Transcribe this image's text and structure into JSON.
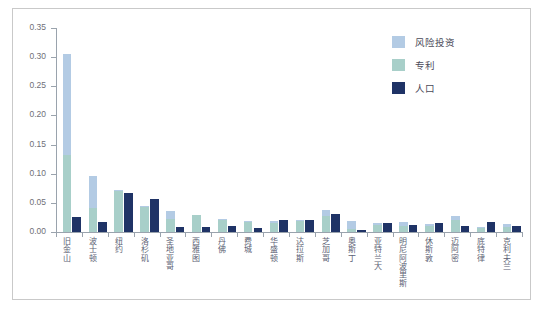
{
  "chart_data": {
    "type": "bar",
    "title": "",
    "subtitle": "",
    "xlabel": "",
    "ylabel": "",
    "ylim": [
      0.0,
      0.35
    ],
    "ytick_labels": [
      "0.00",
      "0.05",
      "0.10",
      "0.15",
      "0.20",
      "0.25",
      "0.30",
      "0.35"
    ],
    "ytick_values": [
      0.0,
      0.05,
      0.1,
      0.15,
      0.2,
      0.25,
      0.3,
      0.35
    ],
    "grid": false,
    "legend_position": "top-right",
    "bar_style": "overlapped-vc-patent-with-offset-population",
    "categories": [
      "旧金山",
      "波士顿",
      "纽约",
      "洛杉矶",
      "圣地亚哥",
      "西雅图",
      "丹佛",
      "费城",
      "华盛顿",
      "达拉斯",
      "芝加哥",
      "奥斯丁",
      "亚特兰大",
      "明尼阿波里斯",
      "休斯敦",
      "迈阿密",
      "底特律",
      "克利夫兰"
    ],
    "series": [
      {
        "name": "风险投资",
        "color": "#b3cbe4",
        "values": [
          0.305,
          0.097,
          0.072,
          0.044,
          0.036,
          0.03,
          0.023,
          0.019,
          0.019,
          0.021,
          0.038,
          0.019,
          0.016,
          0.018,
          0.013,
          0.027,
          0.009,
          0.013
        ]
      },
      {
        "name": "专利",
        "color": "#a8cfc9",
        "values": [
          0.132,
          0.041,
          0.07,
          0.043,
          0.022,
          0.029,
          0.021,
          0.018,
          0.016,
          0.019,
          0.028,
          0.006,
          0.012,
          0.011,
          0.01,
          0.02,
          0.007,
          0.009
        ]
      },
      {
        "name": "人口",
        "color": "#1f3366",
        "values": [
          0.025,
          0.017,
          0.067,
          0.057,
          0.009,
          0.009,
          0.011,
          0.007,
          0.02,
          0.021,
          0.031,
          0.004,
          0.016,
          0.012,
          0.015,
          0.011,
          0.018,
          0.011
        ]
      }
    ]
  },
  "legend": {
    "items": [
      {
        "label": "风险投资",
        "color": "#b3cbe4"
      },
      {
        "label": "专利",
        "color": "#a8cfc9"
      },
      {
        "label": "人口",
        "color": "#1f3366"
      }
    ]
  }
}
